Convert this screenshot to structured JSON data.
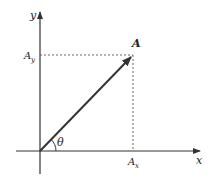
{
  "diagram": {
    "axes": {
      "x_label": "x",
      "y_label": "y"
    },
    "vector": {
      "label": "A",
      "angle_label": "θ"
    },
    "components": {
      "x_component_label": "A",
      "x_component_subscript": "x",
      "y_component_label": "A",
      "y_component_subscript": "y"
    },
    "colors": {
      "lines": "#333333",
      "text": "#222222",
      "background": "#ffffff"
    }
  }
}
